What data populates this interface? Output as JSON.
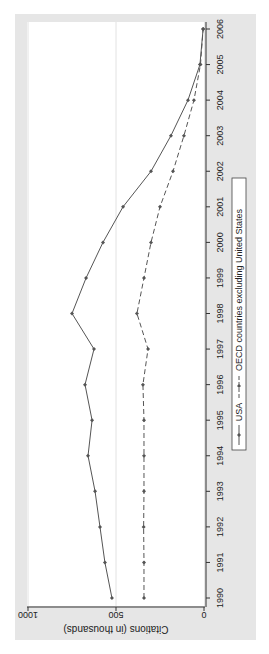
{
  "chart_data": {
    "type": "line",
    "orientation": "rotated-90-clockwise",
    "title": "",
    "xlabel": "",
    "ylabel": "Citations (in thousands)",
    "x": [
      1990,
      1991,
      1992,
      1993,
      1994,
      1995,
      1996,
      1997,
      1998,
      1999,
      2000,
      2001,
      2002,
      2003,
      2004,
      2005,
      2006
    ],
    "ylim": [
      0,
      1000
    ],
    "yticks": [
      0,
      500,
      1000
    ],
    "ytick_labels": [
      "0",
      "500",
      "1000"
    ],
    "xtick_labels": [
      "1990",
      "1991",
      "1992",
      "1993",
      "1994",
      "1995",
      "1996",
      "1997",
      "1998",
      "1999",
      "2000",
      "2001",
      "2002",
      "2003",
      "2004",
      "2005",
      "2006"
    ],
    "grid": true,
    "legend_position": "bottom",
    "series": [
      {
        "name": "USA",
        "style": "solid",
        "marker": "diamond",
        "values": [
          523,
          563,
          591,
          619,
          659,
          636,
          676,
          625,
          750,
          670,
          574,
          460,
          301,
          188,
          91,
          23,
          5
        ]
      },
      {
        "name": "OECD countries excluding United States",
        "style": "dashed",
        "marker": "diamond",
        "values": [
          341,
          341,
          343,
          341,
          341,
          341,
          347,
          318,
          381,
          341,
          301,
          250,
          176,
          114,
          57,
          20,
          5
        ]
      }
    ]
  },
  "colors": {
    "outer_background": "#e6e6e6",
    "plot_background": "#ffffff",
    "line": "#555555",
    "grid": "#e2e2e2"
  }
}
